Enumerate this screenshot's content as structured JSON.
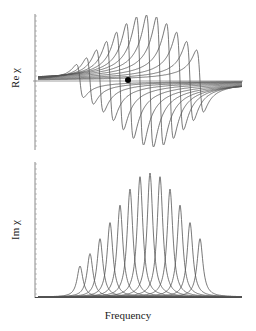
{
  "figure": {
    "top_panel_ylabel": "Re χ",
    "bottom_panel_ylabel": "Im χ",
    "xlabel": "Frequency"
  },
  "colors": {
    "curve": "#555555",
    "axis": "#777777",
    "marker": "#000000",
    "background": "#ffffff"
  },
  "chart_data": [
    {
      "type": "line",
      "title": "",
      "panel": "top",
      "xlabel": "",
      "ylabel": "Re χ",
      "description": "Real part of susceptibility for a family of Lorentzian resonances (dispersive shapes), zero line through center, with a single black dot marker near center",
      "series_count": 13,
      "centers": [
        0.0,
        0.1,
        0.2,
        0.3,
        0.4,
        0.5,
        0.6,
        0.7,
        0.8,
        0.9,
        1.0,
        1.1,
        1.2
      ],
      "amplitudes": [
        0.25,
        0.35,
        0.47,
        0.6,
        0.74,
        0.87,
        0.97,
        1.0,
        0.97,
        0.87,
        0.74,
        0.6,
        0.47
      ],
      "width": 0.035,
      "marker": {
        "x": 0.48,
        "y": 0.0
      },
      "grid": false,
      "legend": null
    },
    {
      "type": "line",
      "title": "",
      "panel": "bottom",
      "xlabel": "Frequency",
      "ylabel": "Im χ",
      "description": "Imaginary part of susceptibility: 13 Lorentzian absorption peaks with envelope maximum near the center",
      "series_count": 13,
      "centers": [
        0.0,
        0.1,
        0.2,
        0.3,
        0.4,
        0.5,
        0.6,
        0.7,
        0.8,
        0.9,
        1.0,
        1.1,
        1.2
      ],
      "amplitudes": [
        0.25,
        0.35,
        0.47,
        0.6,
        0.74,
        0.87,
        0.97,
        1.0,
        0.97,
        0.87,
        0.74,
        0.6,
        0.47
      ],
      "width": 0.035,
      "grid": false,
      "legend": null
    }
  ]
}
